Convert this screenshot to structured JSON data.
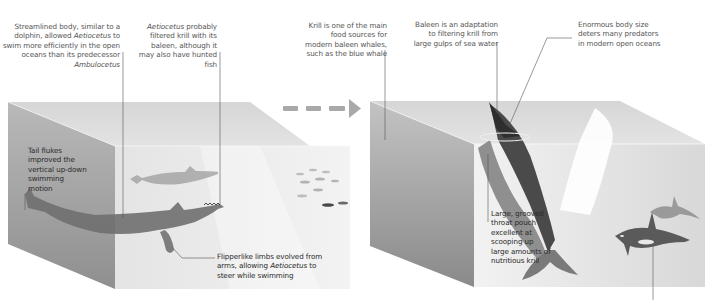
{
  "diagram": {
    "type": "evolution-illustration",
    "panels": [
      {
        "id": "aetiocetus",
        "subject": "Aetiocetus",
        "annotations": {
          "body": {
            "pre": "Streamlined body, similar to a dolphin, allowed ",
            "em": "Aetiocetus",
            "mid": " to swim more efficiently in the open oceans than its predecessor ",
            "em2": "Ambulocetus",
            "post": ""
          },
          "baleen": {
            "em": "Aetiocetus",
            "post": " probably filtered krill with its baleen, although it may also have hunted fish"
          },
          "tail": {
            "text": "Tail flukes improved the vertical up-down swimming motion"
          },
          "limbs": {
            "pre": "Flipperlike limbs evolved from arms, allowing ",
            "em": "Aetiocetus",
            "post": " to steer while swimming"
          }
        }
      },
      {
        "id": "modern-baleen-whale",
        "subject": "Modern baleen whale",
        "annotations": {
          "krill": {
            "text": "Krill is one of the main food sources for modern baleen whales, such as the blue whale"
          },
          "baleen": {
            "text": "Baleen is an adaptation to filtering krill from large gulps of sea water"
          },
          "size": {
            "text": "Enormous body size deters many predators in modern open oceans"
          },
          "pouch": {
            "text": "Large, grooved throat pouch excellent at scooping up large amounts of nutritious krill"
          }
        }
      }
    ],
    "arrow": {
      "direction": "right",
      "style": "dashed",
      "meaning": "evolved-into"
    },
    "colors": {
      "water_dark": "#8c8c8c",
      "water_light": "#e6e6e6",
      "whale": "#6f6f6f",
      "whale_dark": "#3c3c3c",
      "arrow": "#a9a9a9",
      "text": "#555555"
    }
  }
}
